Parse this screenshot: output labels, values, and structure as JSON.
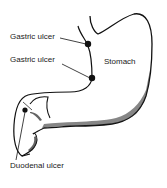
{
  "diagram": {
    "organ_label": "Stomach",
    "labels": [
      {
        "id": "gastric-ulcer-1",
        "text": "Gastric ulcer"
      },
      {
        "id": "gastric-ulcer-2",
        "text": "Gastric ulcer"
      },
      {
        "id": "duodenal-ulcer",
        "text": "Duodenal ulcer"
      }
    ],
    "colors": {
      "ink": "#111111",
      "background": "#ffffff"
    }
  }
}
